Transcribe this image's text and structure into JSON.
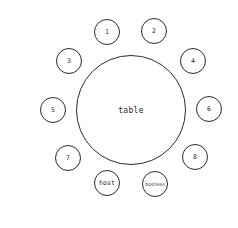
{
  "diagram": {
    "type": "seating-chart",
    "colors": {
      "stroke": "#2a2a2a",
      "background": "#ffffff"
    },
    "table": {
      "label": "table",
      "cx": 131,
      "cy": 110,
      "r": 55
    },
    "seats": [
      {
        "label": "1",
        "cx": 107,
        "cy": 32,
        "r": 13
      },
      {
        "label": "2",
        "cx": 154,
        "cy": 31,
        "r": 13
      },
      {
        "label": "3",
        "cx": 69,
        "cy": 61,
        "r": 13
      },
      {
        "label": "4",
        "cx": 193,
        "cy": 61,
        "r": 13
      },
      {
        "label": "5",
        "cx": 53,
        "cy": 110,
        "r": 13
      },
      {
        "label": "6",
        "cx": 209,
        "cy": 109,
        "r": 13
      },
      {
        "label": "7",
        "cx": 68,
        "cy": 158,
        "r": 13
      },
      {
        "label": "8",
        "cx": 195,
        "cy": 157,
        "r": 13
      },
      {
        "label": "host",
        "cx": 107,
        "cy": 183,
        "r": 13
      },
      {
        "label": "hostess",
        "cx": 155,
        "cy": 184,
        "r": 13
      }
    ]
  }
}
